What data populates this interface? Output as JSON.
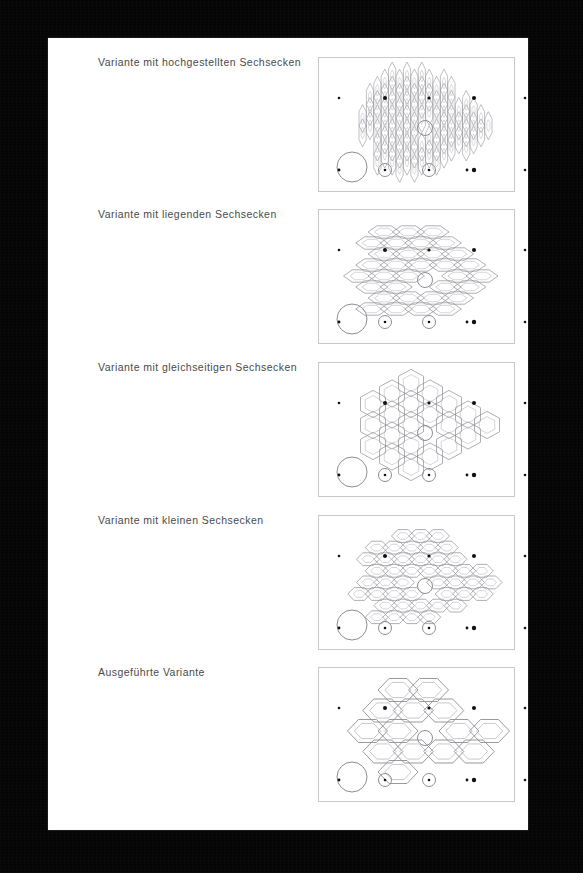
{
  "page": {
    "background_color": "#000000",
    "sheet_color": "#ffffff",
    "text_color": "#4a4a4a",
    "line_color": "#8d8d95"
  },
  "rows": [
    {
      "label": "Variante mit hochgestellten Sechsecken",
      "variant": "tall-hexagons",
      "hex": {
        "rx": 3.6,
        "ry": 14.0,
        "dx": 7.4,
        "dy": 14.2,
        "inner": 0.42,
        "stroke": 0.55
      },
      "grid": {
        "cols": 26,
        "rows": 8,
        "origin_x": 14,
        "origin_y": 18
      }
    },
    {
      "label": "Variante mit liegenden Sechsecken",
      "variant": "flat-wide-hexagons",
      "hex": {
        "rx": 16.0,
        "ry": 6.2,
        "dx": 24.5,
        "dy": 11.0,
        "inner": 0.6,
        "stroke": 0.7
      },
      "grid": {
        "cols": 8,
        "rows": 8,
        "origin_x": 16,
        "origin_y": 22
      }
    },
    {
      "label": "Variante mit gleichseitigen Sechsecken",
      "variant": "equilateral-hexagons",
      "hex": {
        "rx": 12.5,
        "ry": 13.6,
        "dx": 19.0,
        "dy": 21.0,
        "inner": 0.62,
        "stroke": 0.7
      },
      "grid": {
        "cols": 9,
        "rows": 6,
        "origin_x": 16,
        "origin_y": 20
      }
    },
    {
      "label": "Variante mit kleinen Sechsecken",
      "variant": "small-flat-hexagons",
      "hex": {
        "rx": 11.5,
        "ry": 6.4,
        "dx": 17.5,
        "dy": 11.6,
        "inner": 0.52,
        "stroke": 0.7
      },
      "grid": {
        "cols": 11,
        "rows": 8,
        "origin_x": 14,
        "origin_y": 20
      }
    },
    {
      "label": "Ausgeführte Variante",
      "variant": "executed-large-hexagons",
      "hex": {
        "rx": 20.0,
        "ry": 11.5,
        "dx": 30.5,
        "dy": 20.5,
        "inner": 0.66,
        "stroke": 0.9
      },
      "grid": {
        "cols": 6,
        "rows": 5,
        "origin_x": 18,
        "origin_y": 22
      }
    }
  ],
  "panel_markers": {
    "big_circle": {
      "cx": 33,
      "cy": 109,
      "r": 15
    },
    "dotted_circles": [
      {
        "cx": 66,
        "cy": 112,
        "r": 6.5
      },
      {
        "cx": 110,
        "cy": 112,
        "r": 6.5
      }
    ],
    "edge_dots": [
      {
        "cx": 20,
        "cy": 40,
        "r": 1.3
      },
      {
        "cx": 66,
        "cy": 40,
        "r": 2.0
      },
      {
        "cx": 110,
        "cy": 40,
        "r": 1.6
      },
      {
        "cx": 155,
        "cy": 40,
        "r": 2.0
      },
      {
        "cx": 20,
        "cy": 112,
        "r": 1.4
      },
      {
        "cx": 148,
        "cy": 112,
        "r": 1.4
      },
      {
        "cx": 155,
        "cy": 112,
        "r": 2.2
      },
      {
        "cx": 206,
        "cy": 40,
        "r": 1.3
      },
      {
        "cx": 206,
        "cy": 112,
        "r": 1.3
      }
    ],
    "center_void": {
      "cx": 106,
      "cy": 70,
      "r": 7.5
    }
  }
}
